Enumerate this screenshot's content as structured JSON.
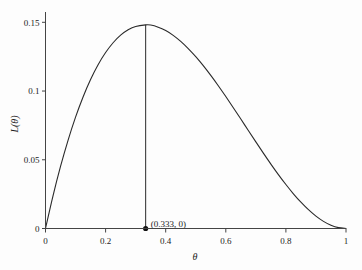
{
  "chart_data": {
    "type": "line",
    "title": "",
    "subtitle": "",
    "xlabel": "θ",
    "ylabel": "L(θ)",
    "xlim": [
      0,
      1
    ],
    "ylim": [
      0,
      0.1575
    ],
    "grid": false,
    "legend": null,
    "x_ticks": [
      "0",
      "0.2",
      "0.4",
      "0.6",
      "0.8",
      "1"
    ],
    "x_tick_values": [
      0,
      0.2,
      0.4,
      0.6,
      0.8,
      1
    ],
    "y_ticks": [
      "0",
      "0.05",
      "0.1",
      "0.15"
    ],
    "y_tick_values": [
      0,
      0.05,
      0.1,
      0.15
    ],
    "series": [
      {
        "name": "L(θ)",
        "color": "#2a2a2a",
        "x": [
          0,
          0.025,
          0.05,
          0.075,
          0.1,
          0.125,
          0.15,
          0.175,
          0.2,
          0.225,
          0.25,
          0.275,
          0.3,
          0.3333,
          0.35,
          0.375,
          0.4,
          0.425,
          0.45,
          0.475,
          0.5,
          0.525,
          0.55,
          0.575,
          0.6,
          0.625,
          0.65,
          0.675,
          0.7,
          0.725,
          0.75,
          0.775,
          0.8,
          0.825,
          0.85,
          0.875,
          0.9,
          0.925,
          0.95,
          0.975,
          1
        ],
        "y": [
          0,
          0.02378,
          0.04513,
          0.06416,
          0.081,
          0.0957,
          0.10838,
          0.11915,
          0.128,
          0.13514,
          0.14063,
          0.14455,
          0.147,
          0.14815,
          0.14804,
          0.14648,
          0.144,
          0.14053,
          0.13612,
          0.13089,
          0.125,
          0.11846,
          0.11138,
          0.10388,
          0.096,
          0.08789,
          0.07963,
          0.07127,
          0.063,
          0.05484,
          0.04688,
          0.03923,
          0.032,
          0.02526,
          0.01913,
          0.01367,
          0.009,
          0.0052,
          0.00238,
          0.00061,
          0
        ]
      }
    ],
    "annotations": [
      {
        "label": "(0.333, 0)",
        "x": 0.3333,
        "y": 0,
        "marker": "filled-circle",
        "dropline_to_y": 0.14815
      }
    ]
  }
}
